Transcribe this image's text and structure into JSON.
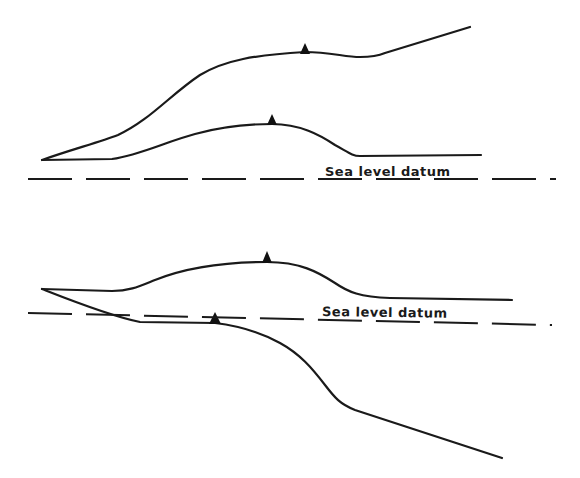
{
  "figure": {
    "panels": [
      {
        "id": "top",
        "description": "Two land-surface profiles above sea level datum, each with a survey marker",
        "datum_label": "Sea level datum",
        "markers": 2
      },
      {
        "id": "bottom",
        "description": "One profile above and one crossing below sea level datum, each with a survey marker",
        "datum_label": "Sea level datum",
        "markers": 2
      }
    ]
  },
  "labels": {
    "top_datum": "Sea level datum",
    "bottom_datum": "Sea level datum"
  },
  "colors": {
    "line": "#1a1a1a",
    "background": "#ffffff"
  }
}
